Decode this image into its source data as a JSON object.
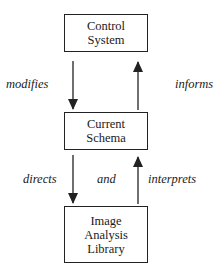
{
  "diagram": {
    "boxes": [
      {
        "id": "control-system",
        "lines": [
          "Control",
          "System"
        ]
      },
      {
        "id": "current-schema",
        "lines": [
          "Current",
          "Schema"
        ]
      },
      {
        "id": "image-analysis-library",
        "lines": [
          "Image",
          "Analysis",
          "Library"
        ]
      }
    ],
    "edges": [
      {
        "from": "control-system",
        "to": "current-schema",
        "label": "modifies"
      },
      {
        "from": "current-schema",
        "to": "control-system",
        "label": "informs"
      },
      {
        "from": "current-schema",
        "to": "image-analysis-library",
        "label": "directs"
      },
      {
        "from": "image-analysis-library",
        "to": "current-schema",
        "label": "interprets"
      }
    ],
    "connector_label": "and",
    "colors": {
      "line": "#222222",
      "background": "#ffffff",
      "text": "#1a1a1a"
    }
  }
}
